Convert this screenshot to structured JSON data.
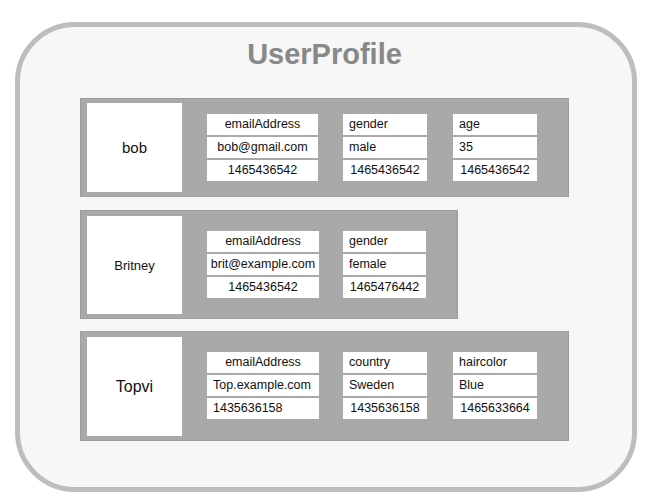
{
  "diagram": {
    "title": "UserProfile",
    "colors": {
      "frame_border": "#bdbdbd",
      "frame_fill": "#f7f7f7",
      "title": "#888888",
      "row_fill": "#a9a9a9",
      "cell_fill": "#ffffff"
    },
    "rows": [
      {
        "key": "bob",
        "columns": [
          {
            "name": "emailAddress",
            "value": "bob@gmail.com",
            "timestamp": "1465436542"
          },
          {
            "name": "gender",
            "value": "male",
            "timestamp": "1465436542"
          },
          {
            "name": "age",
            "value": "35",
            "timestamp": "1465436542"
          }
        ]
      },
      {
        "key": "Britney",
        "columns": [
          {
            "name": "emailAddress",
            "value": "brit@example.com",
            "timestamp": "1465436542"
          },
          {
            "name": "gender",
            "value": "female",
            "timestamp": "1465476442"
          }
        ]
      },
      {
        "key": "Topvi",
        "columns": [
          {
            "name": "emailAddress",
            "value": "Top.example.com",
            "timestamp": "1435636158"
          },
          {
            "name": "country",
            "value": "Sweden",
            "timestamp": "1435636158"
          },
          {
            "name": "haircolor",
            "value": "Blue",
            "timestamp": "1465633664"
          }
        ]
      }
    ]
  }
}
